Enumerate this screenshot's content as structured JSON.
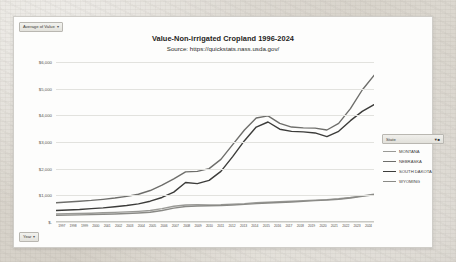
{
  "field_buttons": {
    "value_field": "Average of Value",
    "value_field_icon": "chevron-down-icon",
    "year_field": "Year",
    "year_field_icon": "chevron-down-icon"
  },
  "legend": {
    "header": "State",
    "filter_icon": "filter-icon",
    "entries": [
      {
        "label": "MONTANA",
        "color": "#9a9a96"
      },
      {
        "label": "NEBRASKA",
        "color": "#6e6e6b"
      },
      {
        "label": "SOUTH DAKOTA",
        "color": "#3c3c3a"
      },
      {
        "label": "WYOMING",
        "color": "#8a8a86"
      }
    ]
  },
  "chart_data": {
    "type": "line",
    "title": "Value-Non-irrigated Cropland 1996-2024",
    "subtitle": "Source: https://quickstats.nass.usda.gov/",
    "xlabel": "",
    "ylabel": "",
    "grid": true,
    "legend_position": "right",
    "ylim": [
      0,
      6000
    ],
    "yticks": [
      0,
      1000,
      2000,
      3000,
      4000,
      5000,
      6000
    ],
    "ytick_labels": [
      "$-",
      "$1,000",
      "$2,000",
      "$3,000",
      "$4,000",
      "$5,000",
      "$6,000"
    ],
    "categories": [
      "1997",
      "1998",
      "1999",
      "2000",
      "2001",
      "2002",
      "2003",
      "2004",
      "2005",
      "2006",
      "2007",
      "2008",
      "2009",
      "2010",
      "2011",
      "2012",
      "2013",
      "2014",
      "2015",
      "2016",
      "2017",
      "2018",
      "2019",
      "2020",
      "2021",
      "2022",
      "2023",
      "2024"
    ],
    "series": [
      {
        "name": "MONTANA",
        "color": "#9a9a96",
        "values": [
          300,
          310,
          320,
          330,
          345,
          360,
          380,
          400,
          430,
          500,
          590,
          640,
          650,
          640,
          650,
          670,
          690,
          720,
          740,
          760,
          780,
          800,
          820,
          840,
          870,
          920,
          980,
          1040
        ]
      },
      {
        "name": "NEBRASKA",
        "color": "#6e6e6b",
        "values": [
          720,
          750,
          780,
          810,
          850,
          900,
          960,
          1040,
          1180,
          1380,
          1620,
          1880,
          1900,
          2000,
          2350,
          2900,
          3450,
          3900,
          3980,
          3700,
          3560,
          3530,
          3520,
          3450,
          3700,
          4250,
          4950,
          5500
        ]
      },
      {
        "name": "SOUTH DAKOTA",
        "color": "#3c3c3a",
        "values": [
          430,
          450,
          470,
          500,
          530,
          570,
          620,
          680,
          780,
          920,
          1120,
          1480,
          1440,
          1560,
          1900,
          2450,
          3050,
          3560,
          3750,
          3480,
          3400,
          3380,
          3340,
          3200,
          3400,
          3800,
          4150,
          4400
        ]
      },
      {
        "name": "WYOMING",
        "color": "#8a8a86",
        "values": [
          250,
          258,
          266,
          276,
          288,
          302,
          318,
          338,
          366,
          430,
          520,
          580,
          600,
          610,
          620,
          640,
          660,
          690,
          710,
          730,
          750,
          775,
          800,
          825,
          855,
          900,
          960,
          1020
        ]
      }
    ]
  }
}
